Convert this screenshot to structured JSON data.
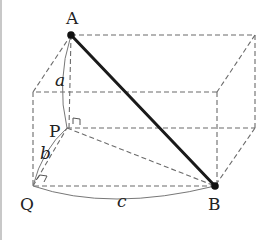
{
  "figure": {
    "points": {
      "A": "A",
      "B": "B",
      "P": "P",
      "Q": "Q"
    },
    "edge_labels": {
      "a": "a",
      "b": "b",
      "c": "c"
    },
    "colors": {
      "diagonal": "#1a1a1a",
      "hidden_edges": "#6b6b6b",
      "arcs": "#777777"
    }
  }
}
